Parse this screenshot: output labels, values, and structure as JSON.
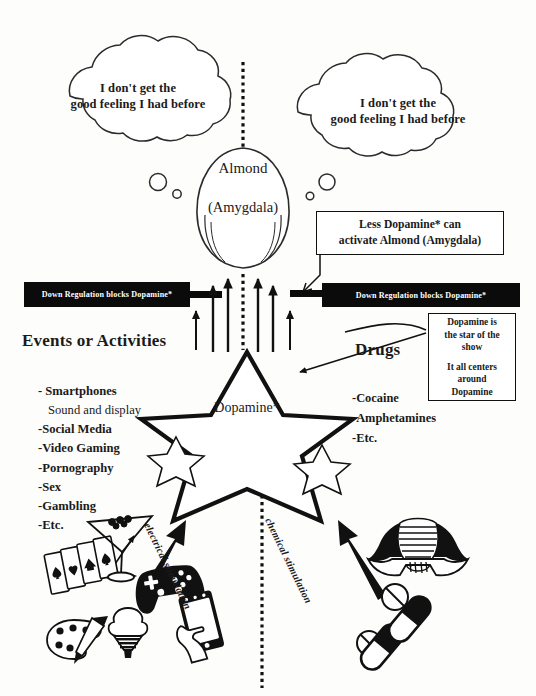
{
  "diagram": {
    "midline": "dotted vertical divider separating Events or Activities from Drugs"
  },
  "thought_bubbles": [
    {
      "id": "left",
      "line1": "I don't get the",
      "line2": "good feeling I had before"
    },
    {
      "id": "right",
      "line1": "I don't get the",
      "line2": "good feeling I had before"
    }
  ],
  "almond": {
    "label": "Almond",
    "sublabel": "(Amygdala)"
  },
  "callout": {
    "line1": "Less Dopamine* can",
    "line2": "activate Almond (Amygdala)"
  },
  "regulation_bars": [
    {
      "id": "left",
      "text": "Down Regulation blocks Dopamine*"
    },
    {
      "id": "right",
      "text": "Down Regulation blocks Dopamine*"
    }
  ],
  "left_column": {
    "heading": "Events or Activities",
    "items": [
      {
        "text": "- Smartphones",
        "style": "bold"
      },
      {
        "text": "Sound and display",
        "style": "plain"
      },
      {
        "text": "-Social Media",
        "style": "bold"
      },
      {
        "text": "-Video Gaming",
        "style": "bold"
      },
      {
        "text": "-Pornography",
        "style": "bold"
      },
      {
        "text": "-Sex",
        "style": "bold"
      },
      {
        "text": "-Gambling",
        "style": "bold"
      },
      {
        "text": "-Etc.",
        "style": "bold"
      }
    ]
  },
  "right_column": {
    "heading": "Drugs",
    "items": [
      {
        "text": "-Cocaine"
      },
      {
        "text": "-Amphetamines"
      },
      {
        "text": "-Etc."
      }
    ]
  },
  "star_box": {
    "line1": "Dopamine is",
    "line2": "the star of the",
    "line3": "show",
    "line4": "It all centers",
    "line5": "around",
    "line6": "Dopamine"
  },
  "center_star": {
    "label": "Dopamine*"
  },
  "stimulation_labels": {
    "left": "electrical stimulation",
    "right": "chemical stimulation"
  },
  "icons": {
    "left_cluster": [
      "playing-cards-icon",
      "martini-glass-icon",
      "game-controller-icon",
      "paint-palette-icon",
      "ice-cream-cone-icon",
      "hand-holding-smartphone-icon"
    ],
    "right_cluster": [
      "person-head-down-icon",
      "pill-capsule-icon",
      "round-tablet-icon"
    ]
  },
  "colors": {
    "ink": "#111111",
    "paper": "#fdfdfb",
    "bar_fill": "#0b0b0b",
    "bar_text": "#ffffff"
  }
}
